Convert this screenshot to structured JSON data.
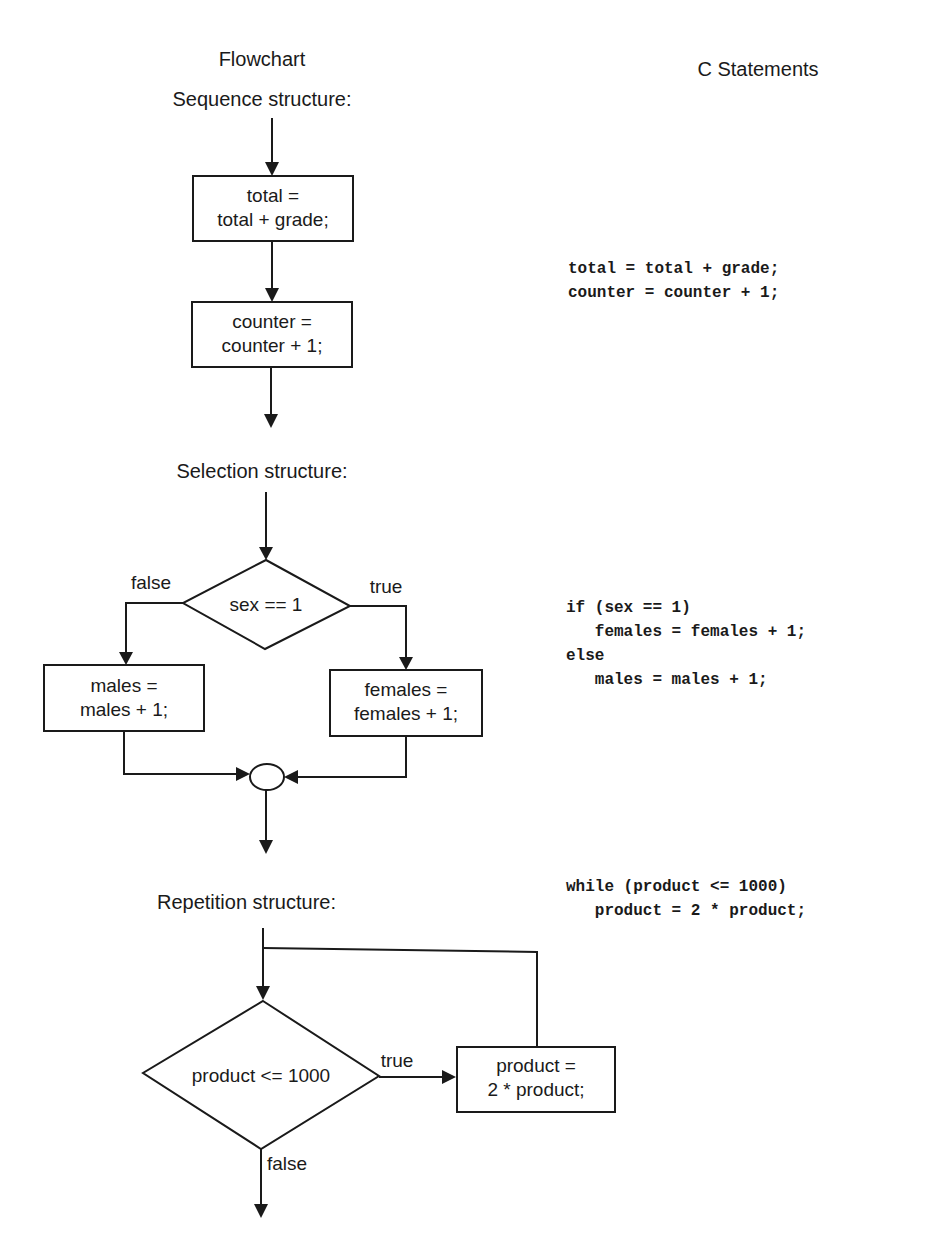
{
  "headers": {
    "flowchart": "Flowchart",
    "statements": "C Statements"
  },
  "sequence": {
    "title": "Sequence structure:",
    "box1": [
      "total =",
      "total + grade;"
    ],
    "box2": [
      "counter =",
      "counter + 1;"
    ],
    "code": [
      "total = total + grade;",
      "counter = counter + 1;"
    ]
  },
  "selection": {
    "title": "Selection structure:",
    "condition": "sex == 1",
    "false_label": "false",
    "true_label": "true",
    "false_box": [
      "males =",
      "males + 1;"
    ],
    "true_box": [
      "females =",
      "females + 1;"
    ],
    "code": [
      "if (sex == 1)",
      "   females = females + 1;",
      "else",
      "   males = males + 1;"
    ]
  },
  "repetition": {
    "title": "Repetition structure:",
    "condition": "product <= 1000",
    "true_label": "true",
    "false_label": "false",
    "body_box": [
      "product =",
      "2 * product;"
    ],
    "code": [
      "while (product <= 1000)",
      "   product = 2 * product;"
    ]
  },
  "colors": {
    "ink": "#1a1a1a",
    "background": "#ffffff"
  }
}
